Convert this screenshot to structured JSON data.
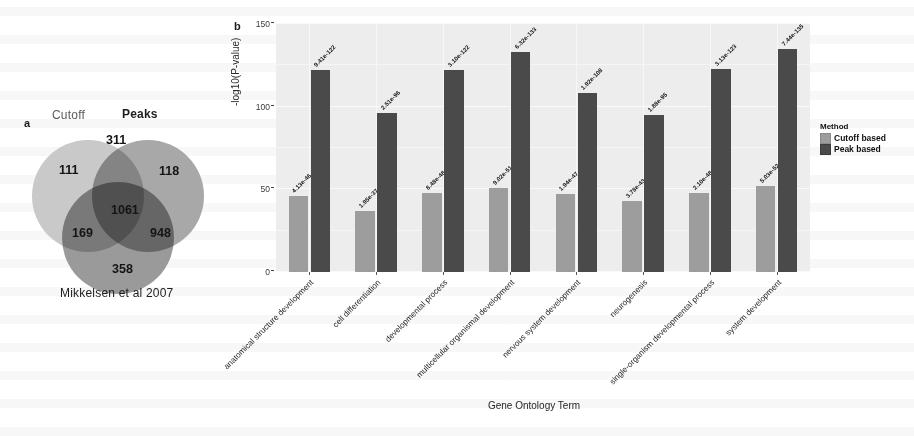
{
  "panels": {
    "a_letter": "a",
    "b_letter": "b"
  },
  "venn": {
    "title_left": "Cutoff",
    "title_right": "Peaks",
    "caption": "Mikkelsen et al 2007",
    "counts": {
      "cutoff_only": "111",
      "cutoff_peaks": "311",
      "peaks_only": "118",
      "all_three": "1061",
      "cutoff_mikkelsen": "169",
      "peaks_mikkelsen": "948",
      "mikkelsen_only": "358"
    },
    "colors": {
      "cutoff": "#c9c9c9",
      "peaks": "#a8a8a8",
      "mikkelsen": "#9a9a9a"
    }
  },
  "legend": {
    "title": "Method",
    "entries": [
      {
        "label": "Cutoff based",
        "color": "#9d9d9d"
      },
      {
        "label": "Peak based",
        "color": "#4a4a4a"
      }
    ]
  },
  "chart_data": {
    "type": "bar",
    "title": "",
    "xlabel": "Gene Ontology Term",
    "ylabel": "-log10(P-value)",
    "ylim": [
      0,
      150
    ],
    "yticks": [
      "0",
      "50",
      "100",
      "150"
    ],
    "grid": true,
    "legend_position": "right",
    "categories": [
      "anatomical structure development",
      "cell differentiation",
      "developmental process",
      "multicellular organismal development",
      "nervous system development",
      "neurogenesis",
      "single-organism developmental process",
      "system development"
    ],
    "series": [
      {
        "name": "Cutoff based",
        "color": "#9d9d9d",
        "values": [
          46,
          37,
          48,
          51,
          47,
          43,
          48,
          52
        ],
        "labels": [
          "4.13e-46",
          "1.95e-37",
          "8.48e-48",
          "9.02e-51",
          "1.94e-47",
          "3.78e-43",
          "2.10e-48",
          "5.03e-52"
        ]
      },
      {
        "name": "Peak based",
        "color": "#4a4a4a",
        "values": [
          122,
          96,
          122,
          133,
          108,
          95,
          123,
          135
        ],
        "labels": [
          "9.41e-122",
          "2.51e-96",
          "3.10e-122",
          "6.32e-133",
          "1.92e-108",
          "1.88e-95",
          "3.13e-123",
          "7.44e-135"
        ]
      }
    ]
  }
}
